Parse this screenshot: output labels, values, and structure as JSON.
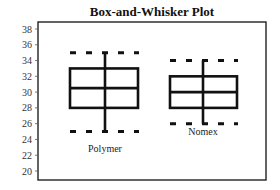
{
  "chart_data": {
    "type": "box",
    "title": "Box-and-Whisker Plot",
    "xlabel": "",
    "ylabel": "",
    "ylim": [
      19,
      39
    ],
    "yticks": [
      20,
      22,
      24,
      26,
      28,
      30,
      32,
      34,
      36,
      38
    ],
    "grid": false,
    "legend": null,
    "categories": [
      "Polymer",
      "Nomex"
    ],
    "series": [
      {
        "name": "Polymer",
        "min": 25,
        "q1": 28,
        "median": 30.5,
        "q3": 33,
        "max": 35
      },
      {
        "name": "Nomex",
        "min": 26,
        "q1": 28,
        "median": 30,
        "q3": 32,
        "max": 34
      }
    ],
    "annotations": []
  }
}
